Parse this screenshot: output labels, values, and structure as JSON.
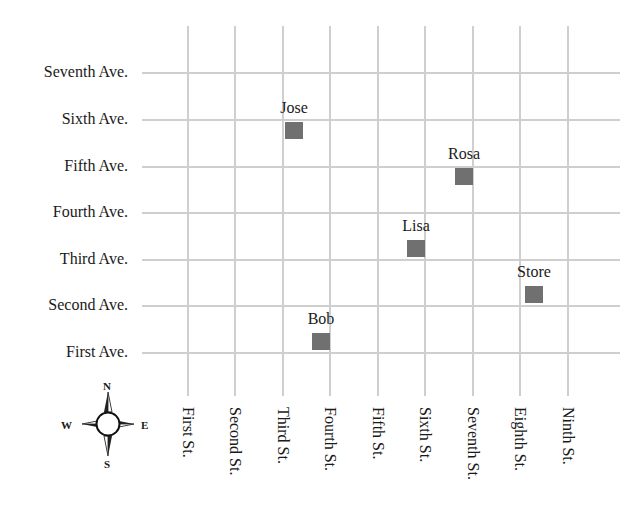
{
  "avenues": [
    {
      "label": "Seventh Ave.",
      "y": 73
    },
    {
      "label": "Sixth Ave.",
      "y": 120
    },
    {
      "label": "Fifth Ave.",
      "y": 167
    },
    {
      "label": "Fourth Ave.",
      "y": 213
    },
    {
      "label": "Third Ave.",
      "y": 260
    },
    {
      "label": "Second Ave.",
      "y": 306
    },
    {
      "label": "First Ave.",
      "y": 353
    }
  ],
  "streets": [
    {
      "label": "First St.",
      "x": 188
    },
    {
      "label": "Second St.",
      "x": 235
    },
    {
      "label": "Third St.",
      "x": 283
    },
    {
      "label": "Fourth St.",
      "x": 330
    },
    {
      "label": "Fifth St.",
      "x": 378
    },
    {
      "label": "Sixth St.",
      "x": 425
    },
    {
      "label": "Seventh St.",
      "x": 473
    },
    {
      "label": "Eighth St.",
      "x": 520
    },
    {
      "label": "Ninth St.",
      "x": 568
    }
  ],
  "locations": [
    {
      "name": "Jose",
      "x": 285,
      "y": 122
    },
    {
      "name": "Rosa",
      "x": 455,
      "y": 168
    },
    {
      "name": "Lisa",
      "x": 407,
      "y": 240
    },
    {
      "name": "Store",
      "x": 525,
      "y": 286
    },
    {
      "name": "Bob",
      "x": 312,
      "y": 333
    }
  ],
  "compass": {
    "north": "N",
    "south": "S",
    "east": "E",
    "west": "W"
  },
  "colors": {
    "grid": "#cfcfcf",
    "marker": "#707070",
    "text": "#1a1a1a"
  }
}
